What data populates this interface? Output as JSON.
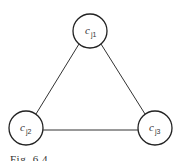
{
  "nodes": [
    {
      "id": "cj1",
      "label": "c",
      "sub": "j1",
      "cx": 90,
      "cy": 31,
      "r": 17
    },
    {
      "id": "cj2",
      "label": "c",
      "sub": "j2",
      "cx": 26,
      "cy": 128,
      "r": 17
    },
    {
      "id": "cj3",
      "label": "c",
      "sub": "j3",
      "cx": 155,
      "cy": 128,
      "r": 17
    }
  ],
  "edges": [
    {
      "from": "cj1",
      "to": "cj2"
    },
    {
      "from": "cj1",
      "to": "cj3"
    },
    {
      "from": "cj2",
      "to": "cj3"
    }
  ],
  "caption": "Fig. 6.4"
}
